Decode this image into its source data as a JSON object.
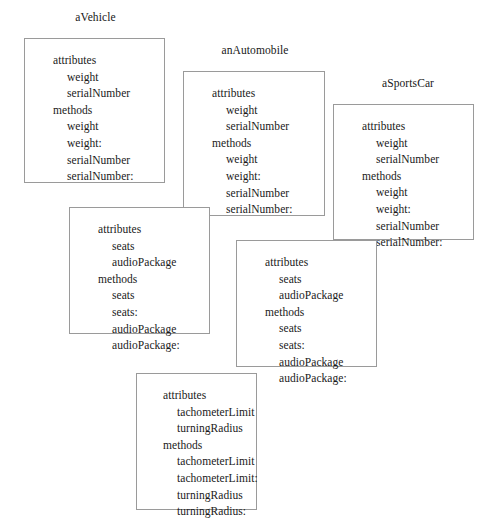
{
  "diagram": {
    "title_labels": [
      {
        "text": "aVehicle",
        "left": 48,
        "top": 11,
        "width": 95
      },
      {
        "text": "anAutomobile",
        "left": 196,
        "top": 44,
        "width": 118
      },
      {
        "text": "aSportsCar",
        "left": 355,
        "top": 77,
        "width": 106
      }
    ],
    "section_labels": {
      "attributes": "attributes",
      "methods": "methods"
    },
    "boxes": [
      {
        "name": "vehicle-public-box",
        "left": 24,
        "top": 38,
        "width": 141,
        "height": 145,
        "text_left": 28,
        "text_top": 6,
        "attributes_label": "attributes",
        "attributes": [
          "weight",
          "serialNumber"
        ],
        "methods_label": "methods",
        "methods": [
          "weight",
          "weight:",
          "serialNumber",
          "serialNumber:"
        ]
      },
      {
        "name": "automobile-inherited-vehicle-box",
        "left": 183,
        "top": 71,
        "width": 142,
        "height": 145,
        "text_left": 28,
        "text_top": 6,
        "attributes_label": "attributes",
        "attributes": [
          "weight",
          "serialNumber"
        ],
        "methods_label": "methods",
        "methods": [
          "weight",
          "weight:",
          "serialNumber",
          "serialNumber:"
        ]
      },
      {
        "name": "sportscar-inherited-vehicle-box",
        "left": 333,
        "top": 104,
        "width": 141,
        "height": 136,
        "text_left": 28,
        "text_top": 6,
        "attributes_label": "attributes",
        "attributes": [
          "weight",
          "serialNumber"
        ],
        "methods_label": "methods",
        "methods": [
          "weight",
          "weight:",
          "serialNumber",
          "serialNumber:"
        ]
      },
      {
        "name": "automobile-own-box",
        "left": 69,
        "top": 207,
        "width": 141,
        "height": 127,
        "text_left": 28,
        "text_top": 6,
        "attributes_label": "attributes",
        "attributes": [
          "seats",
          "audioPackage"
        ],
        "methods_label": "methods",
        "methods": [
          "seats",
          "seats:",
          "audioPackage",
          "audioPackage:"
        ]
      },
      {
        "name": "sportscar-inherited-automobile-box",
        "left": 236,
        "top": 240,
        "width": 141,
        "height": 127,
        "text_left": 28,
        "text_top": 6,
        "attributes_label": "attributes",
        "attributes": [
          "seats",
          "audioPackage"
        ],
        "methods_label": "methods",
        "methods": [
          "seats",
          "seats:",
          "audioPackage",
          "audioPackage:"
        ]
      },
      {
        "name": "sportscar-own-box",
        "left": 136,
        "top": 373,
        "width": 121,
        "height": 137,
        "text_left": 26,
        "text_top": 6,
        "attributes_label": "attributes",
        "attributes": [
          "tachometerLimit",
          "turningRadius"
        ],
        "methods_label": "methods",
        "methods": [
          "tachometerLimit",
          "tachometerLimit:",
          "turningRadius",
          "turningRadius:"
        ]
      }
    ],
    "colors": {
      "border": "#9a9a9a",
      "text": "#171717",
      "background": "#ffffff"
    }
  }
}
